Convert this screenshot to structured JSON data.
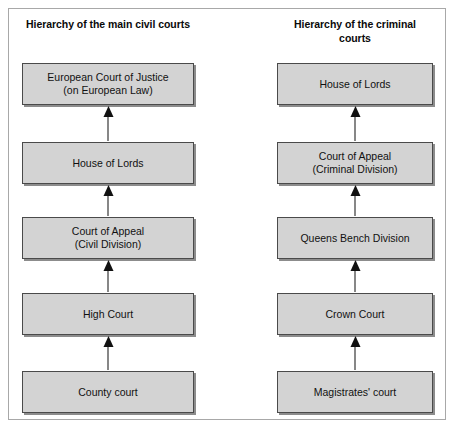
{
  "figure": {
    "columns": [
      {
        "id": "civil",
        "title": "Hierarchy of the main\ncivil courts",
        "nodes": [
          {
            "label": "European Court of Justice\n(on European Law)"
          },
          {
            "label": "House of Lords"
          },
          {
            "label": "Court of Appeal\n(Civil Division)"
          },
          {
            "label": "High Court"
          },
          {
            "label": "County court"
          }
        ]
      },
      {
        "id": "criminal",
        "title": "Hierarchy of the\ncriminal courts",
        "nodes": [
          {
            "label": "House of Lords"
          },
          {
            "label": "Court of Appeal\n(Criminal Division)"
          },
          {
            "label": "Queens Bench Division"
          },
          {
            "label": "Crown Court"
          },
          {
            "label": "Magistrates' court"
          }
        ]
      }
    ],
    "colors": {
      "node_fill": "#d3d3d3",
      "node_border": "#4a4a4a",
      "node_shadow": "#8c8c8c",
      "frame_border": "#a8a8a8",
      "arrow": "#111111",
      "background": "#ffffff"
    },
    "arrow_icon": "arrow-up-icon",
    "arrow_direction": "up"
  }
}
